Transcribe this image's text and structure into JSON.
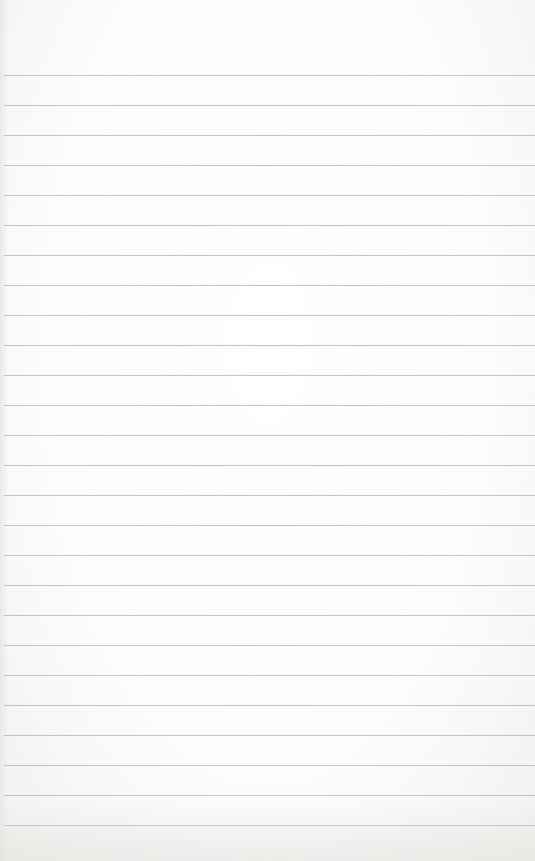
{
  "paper": {
    "type": "lined-notepad",
    "background_color": "#fbfbfa",
    "line_color": "#b9b9b9",
    "first_line_y": 75,
    "line_spacing": 30,
    "line_count": 26
  }
}
